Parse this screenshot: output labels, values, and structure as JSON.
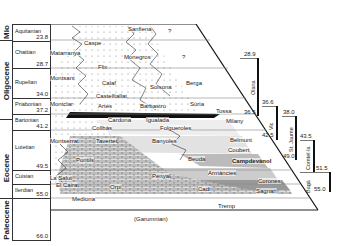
{
  "diagram": {
    "type": "chronostratigraphic chart",
    "epochs": [
      {
        "name": "Mio",
        "top": 24,
        "height": 16
      },
      {
        "name": "Oligocene",
        "top": 40,
        "height": 79
      },
      {
        "name": "Eocene",
        "top": 119,
        "height": 96
      },
      {
        "name": "Paleocene",
        "top": 215,
        "height": 25
      }
    ],
    "stages": [
      {
        "name": "Aquitanian",
        "age": "23.8",
        "top": 24,
        "height": 16
      },
      {
        "name": "Chattian",
        "age": "28.7",
        "top": 40,
        "height": 28
      },
      {
        "name": "Rupelian",
        "age": "34.0",
        "top": 68,
        "height": 30
      },
      {
        "name": "Priabonian",
        "age": "37.2",
        "top": 98,
        "height": 16
      },
      {
        "name": "Bartonian",
        "age": "41.2",
        "top": 114,
        "height": 16
      },
      {
        "name": "Lutetian",
        "age": "49.5",
        "top": 130,
        "height": 40
      },
      {
        "name": "Cuisian",
        "age": "",
        "top": 170,
        "height": 14
      },
      {
        "name": "Ilerdian",
        "age": "55.0",
        "top": 184,
        "height": 14
      },
      {
        "name": "",
        "age": "66.0",
        "top": 198,
        "height": 42
      }
    ],
    "formations": [
      {
        "name": "Sanfiena",
        "x": 128,
        "y": 26
      },
      {
        "name": "?",
        "x": 168,
        "y": 28
      },
      {
        "name": "Caspe",
        "x": 84,
        "y": 40
      },
      {
        "name": "Matarranya",
        "x": 50,
        "y": 50
      },
      {
        "name": "Monegros",
        "x": 124,
        "y": 54
      },
      {
        "name": "?",
        "x": 182,
        "y": 54
      },
      {
        "name": "Flix",
        "x": 98,
        "y": 64
      },
      {
        "name": "Montsant",
        "x": 50,
        "y": 75
      },
      {
        "name": "Calaf",
        "x": 102,
        "y": 80
      },
      {
        "name": "Berga",
        "x": 186,
        "y": 80
      },
      {
        "name": "Solsona",
        "x": 150,
        "y": 84
      },
      {
        "name": "Castelltallat",
        "x": 96,
        "y": 93
      },
      {
        "name": "Montclar",
        "x": 50,
        "y": 101
      },
      {
        "name": "Artés",
        "x": 98,
        "y": 103
      },
      {
        "name": "Barbastro",
        "x": 140,
        "y": 103
      },
      {
        "name": "Súria",
        "x": 190,
        "y": 101
      },
      {
        "name": "Tossa",
        "x": 216,
        "y": 108
      },
      {
        "name": "Cardona",
        "x": 108,
        "y": 117
      },
      {
        "name": "Igualada",
        "x": 146,
        "y": 117
      },
      {
        "name": "Milany",
        "x": 226,
        "y": 118
      },
      {
        "name": "Collbàs",
        "x": 92,
        "y": 125
      },
      {
        "name": "Folgueroles",
        "x": 160,
        "y": 125
      },
      {
        "name": "Montserrat",
        "x": 50,
        "y": 138
      },
      {
        "name": "Tavertet",
        "x": 96,
        "y": 138
      },
      {
        "name": "Banyoles",
        "x": 152,
        "y": 138
      },
      {
        "name": "Belmunt",
        "x": 230,
        "y": 137
      },
      {
        "name": "Coubert",
        "x": 228,
        "y": 147
      },
      {
        "name": "Pontils",
        "x": 76,
        "y": 157
      },
      {
        "name": "Beuda",
        "x": 188,
        "y": 156
      },
      {
        "name": "Campdevànol",
        "x": 232,
        "y": 158
      },
      {
        "name": "Armàncies",
        "x": 208,
        "y": 170
      },
      {
        "name": "La Salut",
        "x": 50,
        "y": 175
      },
      {
        "name": "Penyal",
        "x": 152,
        "y": 173
      },
      {
        "name": "Corones",
        "x": 258,
        "y": 178
      },
      {
        "name": "El Cairat",
        "x": 56,
        "y": 182
      },
      {
        "name": "Orpí",
        "x": 110,
        "y": 184
      },
      {
        "name": "Cadí",
        "x": 198,
        "y": 186
      },
      {
        "name": "Sagnari",
        "x": 256,
        "y": 188
      },
      {
        "name": "Mediona",
        "x": 72,
        "y": 196
      },
      {
        "name": "Tremp",
        "x": 218,
        "y": 203
      },
      {
        "name": "(Garumnian)",
        "x": 134,
        "y": 216
      }
    ],
    "sequences": [
      {
        "name": "Olana",
        "top_age": "28.9",
        "bottom_age": "36.5",
        "x": 254,
        "top": 58,
        "bottom": 117
      },
      {
        "name": "Vic",
        "top_age": "36.6",
        "bottom_age": "42.5",
        "x": 272,
        "top": 105,
        "bottom": 140
      },
      {
        "name": "St. Jaume",
        "top_age": "38.0",
        "bottom_age": "49.0",
        "x": 291,
        "top": 115,
        "bottom": 160
      },
      {
        "name": "Comtel·la",
        "top_age": "43.5",
        "bottom_age": "51.5",
        "x": 314,
        "top": 132,
        "bottom": 172
      },
      {
        "name": "Bagà",
        "top_age": "51.5",
        "bottom_age": "55.0",
        "x": 330,
        "top": 170,
        "bottom": 190
      }
    ]
  }
}
